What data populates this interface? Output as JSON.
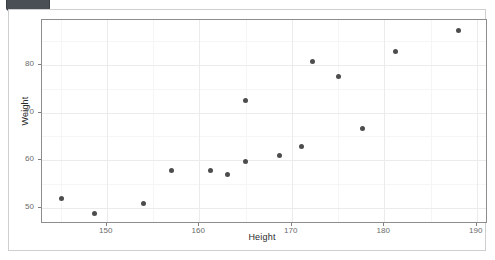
{
  "widget": {
    "badge_label": ""
  },
  "chart_data": {
    "type": "scatter",
    "title": "",
    "xlabel": "Height",
    "ylabel": "Weight",
    "xlim": [
      143.0,
      191.0
    ],
    "ylim": [
      47.0,
      89.5
    ],
    "x_ticks": [
      150,
      160,
      170,
      180,
      190
    ],
    "x_tick_labels": [
      "150",
      "160",
      "170",
      "180",
      "190"
    ],
    "y_ticks": [
      50,
      60,
      70,
      80
    ],
    "y_tick_labels": [
      "50",
      "60",
      "70",
      "80"
    ],
    "x_minor_ticks": [
      145,
      155,
      165,
      175,
      185
    ],
    "y_minor_ticks": [
      55,
      65,
      75,
      85
    ],
    "grid": true,
    "legend": "none",
    "point_color": "#4d4d4d",
    "panel_background": "#ffffff",
    "grid_major_color": "#ebebeb",
    "grid_minor_color": "#f5f5f5",
    "points": [
      {
        "x": 145.1,
        "y": 52.0
      },
      {
        "x": 148.7,
        "y": 48.8
      },
      {
        "x": 154.0,
        "y": 50.9
      },
      {
        "x": 157.0,
        "y": 57.8
      },
      {
        "x": 161.2,
        "y": 57.8
      },
      {
        "x": 163.0,
        "y": 57.0
      },
      {
        "x": 165.0,
        "y": 59.8
      },
      {
        "x": 165.0,
        "y": 72.5
      },
      {
        "x": 168.7,
        "y": 61.0
      },
      {
        "x": 171.1,
        "y": 62.9
      },
      {
        "x": 172.2,
        "y": 80.8
      },
      {
        "x": 175.0,
        "y": 77.7
      },
      {
        "x": 177.6,
        "y": 66.7
      },
      {
        "x": 181.2,
        "y": 82.8
      },
      {
        "x": 188.0,
        "y": 87.2
      }
    ]
  }
}
